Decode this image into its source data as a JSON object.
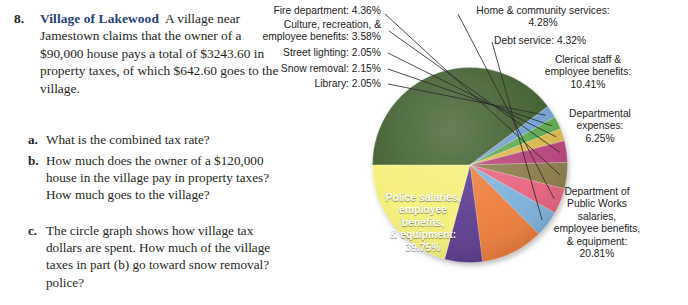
{
  "problem": {
    "number": "8.",
    "title": "Village of Lakewood",
    "body": "A village near Jamestown claims that the owner of a $90,000 house pays a total of $3243.60 in property taxes, of which $642.60 goes to the village.",
    "items": [
      {
        "letter": "a.",
        "text": "What is the combined tax rate?"
      },
      {
        "letter": "b.",
        "text": "How much does the owner of a $120,000 house in the village pay in property taxes? How much goes to the village?"
      },
      {
        "letter": "c.",
        "text": "The circle graph shows how village tax dollars are spent. How much of the village taxes in part (b) go toward snow removal? police?"
      }
    ],
    "title_color": "#23417a"
  },
  "chart_data": {
    "type": "pie",
    "title": "",
    "legend_position": "callouts",
    "unit": "percent",
    "categories": [
      "Police salaries, employee benefits, & equipment",
      "Library",
      "Snow removal",
      "Street lighting",
      "Culture, recreation, & employee benefits",
      "Fire department",
      "Home & community services",
      "Debt service",
      "Clerical staff & employee benefits",
      "Departmental expenses",
      "Department of Public Works salaries, employee benefits, & equipment"
    ],
    "values": [
      39.75,
      2.05,
      2.15,
      2.05,
      3.58,
      4.36,
      4.28,
      4.32,
      10.41,
      6.25,
      20.81
    ],
    "colors": [
      "#3d5c2a",
      "#6f9fd0",
      "#5aa84b",
      "#d8b64a",
      "#b8437a",
      "#8a7b4a",
      "#e8647f",
      "#7fb2dc",
      "#ed7d3a",
      "#5b3a8e",
      "#f5f078"
    ],
    "labels": [
      "Police salaries,\nemployee\nbenefits,\n& equipment:\n39.75%",
      "Library: 2.05%",
      "Snow removal: 2.15%",
      "Street lighting: 2.05%",
      "Culture, recreation, &\nemployee benefits: 3.58%",
      "Fire department: 4.36%",
      "Home & community services:\n4.28%",
      "Debt service: 4.32%",
      "Clerical staff &\nemployee benefits:\n10.41%",
      "Departmental\nexpenses:\n6.25%",
      "Department of\nPublic Works\nsalaries,\nemployee benefits,\n& equipment:\n20.81%"
    ]
  }
}
